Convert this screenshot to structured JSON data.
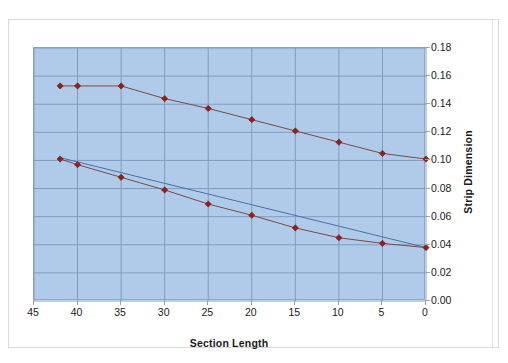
{
  "chart_data": {
    "type": "line",
    "title": "",
    "xlabel": "Section Length",
    "ylabel": "Strip Dimension",
    "xlim": [
      45,
      0
    ],
    "ylim": [
      0.0,
      0.18
    ],
    "x_ticks": [
      "45",
      "40",
      "35",
      "30",
      "25",
      "20",
      "15",
      "10",
      "5",
      "0"
    ],
    "x_tick_values": [
      45,
      40,
      35,
      30,
      25,
      20,
      15,
      10,
      5,
      0
    ],
    "y_ticks": [
      "0.00",
      "0.02",
      "0.04",
      "0.06",
      "0.08",
      "0.10",
      "0.12",
      "0.14",
      "0.16",
      "0.18"
    ],
    "y_tick_values": [
      0.0,
      0.02,
      0.04,
      0.06,
      0.08,
      0.1,
      0.12,
      0.14,
      0.16,
      0.18
    ],
    "x_axis_reversed": true,
    "y_axis_position": "right",
    "grid": true,
    "legend": "none",
    "plot_background": "#b0cbe9",
    "gridline_color": "#7f9cc0",
    "marker_color": "#8c2318",
    "line_color": "#7a4a44",
    "straight_line_color": "#4a6fa5",
    "series": [
      {
        "name": "upper-strip-dimension",
        "marker": "diamond",
        "x": [
          42,
          40,
          35,
          30,
          25,
          20,
          15,
          10,
          5,
          0
        ],
        "values": [
          0.153,
          0.153,
          0.153,
          0.144,
          0.137,
          0.129,
          0.121,
          0.113,
          0.105,
          0.101
        ]
      },
      {
        "name": "lower-strip-dimension",
        "marker": "diamond",
        "x": [
          42,
          40,
          35,
          30,
          25,
          20,
          15,
          10,
          5,
          0
        ],
        "values": [
          0.101,
          0.097,
          0.088,
          0.079,
          0.069,
          0.061,
          0.052,
          0.045,
          0.041,
          0.038
        ]
      },
      {
        "name": "lower-reference-line",
        "marker": "none",
        "x": [
          42,
          0
        ],
        "values": [
          0.102,
          0.038
        ]
      }
    ]
  },
  "axis": {
    "x_title": "Section Length",
    "y_title": "Strip Dimension"
  }
}
